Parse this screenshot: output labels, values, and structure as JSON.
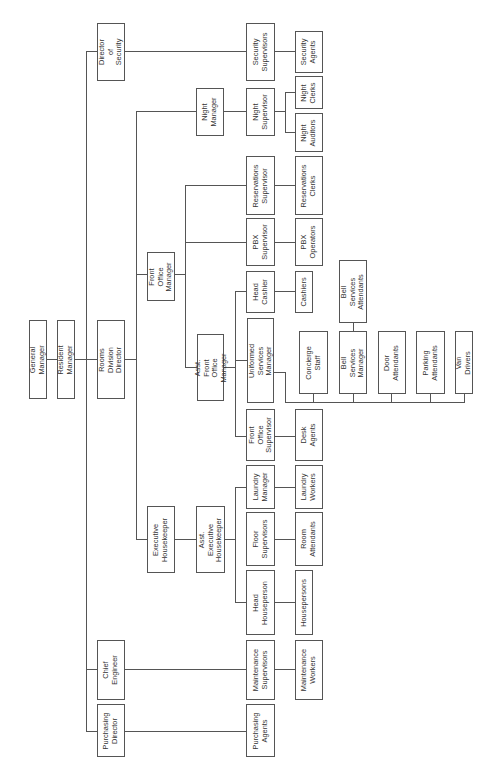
{
  "diagram": {
    "type": "org-chart",
    "orientation": "rotated-90-ccw",
    "line_color": "#555555",
    "nodes": [
      {
        "id": "general-manager",
        "label": "General Manager",
        "box": [
          29,
          320,
          46,
          398
        ]
      },
      {
        "id": "resident-manager",
        "label": "Resident Manager",
        "box": [
          57,
          320,
          74,
          398
        ]
      },
      {
        "id": "rooms-division-director",
        "label": "Rooms Division\nDirector",
        "box": [
          97,
          320,
          124,
          398
        ]
      },
      {
        "id": "director-of-security",
        "label": "Director of\nSecurity",
        "box": [
          97,
          23,
          124,
          80
        ]
      },
      {
        "id": "chief-engineer",
        "label": "Chief\nEngineer",
        "box": [
          97,
          640,
          124,
          699
        ]
      },
      {
        "id": "purchasing-director",
        "label": "Purchasing\nDirector",
        "box": [
          97,
          704,
          124,
          756
        ]
      },
      {
        "id": "front-office-manager",
        "label": "Front Office\nManager",
        "box": [
          147,
          252,
          174,
          300
        ]
      },
      {
        "id": "executive-housekeeper",
        "label": "Executive\nHousekeeper",
        "box": [
          147,
          506,
          174,
          572
        ]
      },
      {
        "id": "night-manager",
        "label": "Night\nManager",
        "box": [
          196,
          88,
          223,
          135
        ]
      },
      {
        "id": "asst-front-office-manager",
        "label": "Asst. Front\nOffice Manager",
        "box": [
          197,
          334,
          223,
          400
        ]
      },
      {
        "id": "asst-executive-housekeeper",
        "label": "Asst. Executive\nHousekeeper",
        "box": [
          196,
          506,
          224,
          572
        ]
      },
      {
        "id": "security-supervisors",
        "label": "Security\nSupervisors",
        "box": [
          246,
          23,
          274,
          80
        ]
      },
      {
        "id": "night-supervisor",
        "label": "Night\nSupervisor",
        "box": [
          246,
          88,
          274,
          135
        ]
      },
      {
        "id": "reservations-supervisor",
        "label": "Reservations\nSupervisor",
        "box": [
          246,
          156,
          274,
          214
        ]
      },
      {
        "id": "pbx-supervisor",
        "label": "PBX\nSupervisor",
        "box": [
          246,
          218,
          274,
          265
        ]
      },
      {
        "id": "head-cashier",
        "label": "Head\nCashier",
        "box": [
          246,
          271,
          274,
          312
        ]
      },
      {
        "id": "uniformed-services-manager",
        "label": "Uniformed Services\nManager",
        "box": [
          247,
          318,
          273,
          402
        ]
      },
      {
        "id": "front-office-supervisor",
        "label": "Front Office\nSupervisor",
        "box": [
          246,
          409,
          274,
          460
        ]
      },
      {
        "id": "laundry-manager",
        "label": "Laundry\nManager",
        "box": [
          246,
          465,
          274,
          508
        ]
      },
      {
        "id": "floor-supervisors",
        "label": "Floor\nSupervisors",
        "box": [
          246,
          512,
          274,
          565
        ]
      },
      {
        "id": "head-houseperson",
        "label": "Head\nHouseperson",
        "box": [
          246,
          570,
          274,
          634
        ]
      },
      {
        "id": "maintenance-supervisors",
        "label": "Maintenance\nSupervisors",
        "box": [
          246,
          640,
          274,
          699
        ]
      },
      {
        "id": "purchasing-agents",
        "label": "Purchasing\nAgents",
        "box": [
          246,
          704,
          274,
          756
        ]
      },
      {
        "id": "security-agents",
        "label": "Security\nAgents",
        "box": [
          295,
          31,
          322,
          72
        ]
      },
      {
        "id": "night-clerks",
        "label": "Night\nClerks",
        "box": [
          295,
          76,
          322,
          108
        ]
      },
      {
        "id": "night-auditors",
        "label": "Night\nAuditors",
        "box": [
          295,
          113,
          322,
          151
        ]
      },
      {
        "id": "reservations-clerks",
        "label": "Reservations\nClerks",
        "box": [
          295,
          156,
          322,
          214
        ]
      },
      {
        "id": "pbx-operators",
        "label": "PBX\nOperators",
        "box": [
          295,
          218,
          322,
          265
        ]
      },
      {
        "id": "cashiers",
        "label": "Cashiers",
        "box": [
          295,
          271,
          312,
          312
        ]
      },
      {
        "id": "concierge-staff",
        "label": "Concierge\nStaff",
        "box": [
          299,
          331,
          327,
          393
        ]
      },
      {
        "id": "desk-agents",
        "label": "Desk\nAgents",
        "box": [
          295,
          409,
          322,
          460
        ]
      },
      {
        "id": "laundry-workers",
        "label": "Laundry\nWorkers",
        "box": [
          295,
          465,
          322,
          508
        ]
      },
      {
        "id": "room-attendants",
        "label": "Room\nAttendants",
        "box": [
          295,
          512,
          322,
          565
        ]
      },
      {
        "id": "housepersons",
        "label": "Housepersons",
        "box": [
          295,
          570,
          312,
          634
        ]
      },
      {
        "id": "maintenance-workers",
        "label": "Maintenance\nWorkers",
        "box": [
          295,
          640,
          322,
          699
        ]
      },
      {
        "id": "bell-services-attendants",
        "label": "Bell Services\nAttendants",
        "box": [
          339,
          260,
          366,
          322
        ]
      },
      {
        "id": "bell-services-manager",
        "label": "Bell Services\nManager",
        "box": [
          339,
          331,
          366,
          393
        ]
      },
      {
        "id": "door-attendants",
        "label": "Door\nAttendants",
        "box": [
          378,
          331,
          405,
          393
        ]
      },
      {
        "id": "parking-attendants",
        "label": "Parking\nAttendants",
        "box": [
          416,
          331,
          444,
          393
        ]
      },
      {
        "id": "van-drivers",
        "label": "Van Drivers",
        "box": [
          455,
          331,
          472,
          393
        ]
      }
    ],
    "edges": [
      [
        "general-manager",
        "resident-manager"
      ],
      [
        "resident-manager",
        "director-of-security"
      ],
      [
        "resident-manager",
        "rooms-division-director"
      ],
      [
        "resident-manager",
        "chief-engineer"
      ],
      [
        "resident-manager",
        "purchasing-director"
      ],
      [
        "director-of-security",
        "security-supervisors"
      ],
      [
        "security-supervisors",
        "security-agents"
      ],
      [
        "rooms-division-director",
        "night-manager"
      ],
      [
        "rooms-division-director",
        "front-office-manager"
      ],
      [
        "rooms-division-director",
        "executive-housekeeper"
      ],
      [
        "night-manager",
        "night-supervisor"
      ],
      [
        "night-supervisor",
        "night-clerks"
      ],
      [
        "night-supervisor",
        "night-auditors"
      ],
      [
        "front-office-manager",
        "reservations-supervisor"
      ],
      [
        "front-office-manager",
        "pbx-supervisor"
      ],
      [
        "front-office-manager",
        "asst-front-office-manager"
      ],
      [
        "reservations-supervisor",
        "reservations-clerks"
      ],
      [
        "pbx-supervisor",
        "pbx-operators"
      ],
      [
        "asst-front-office-manager",
        "head-cashier"
      ],
      [
        "asst-front-office-manager",
        "uniformed-services-manager"
      ],
      [
        "asst-front-office-manager",
        "front-office-supervisor"
      ],
      [
        "head-cashier",
        "cashiers"
      ],
      [
        "front-office-supervisor",
        "desk-agents"
      ],
      [
        "uniformed-services-manager",
        "concierge-staff"
      ],
      [
        "uniformed-services-manager",
        "bell-services-manager"
      ],
      [
        "uniformed-services-manager",
        "door-attendants"
      ],
      [
        "uniformed-services-manager",
        "parking-attendants"
      ],
      [
        "uniformed-services-manager",
        "van-drivers"
      ],
      [
        "bell-services-manager",
        "bell-services-attendants"
      ],
      [
        "executive-housekeeper",
        "asst-executive-housekeeper"
      ],
      [
        "asst-executive-housekeeper",
        "laundry-manager"
      ],
      [
        "asst-executive-housekeeper",
        "floor-supervisors"
      ],
      [
        "asst-executive-housekeeper",
        "head-houseperson"
      ],
      [
        "laundry-manager",
        "laundry-workers"
      ],
      [
        "floor-supervisors",
        "room-attendants"
      ],
      [
        "head-houseperson",
        "housepersons"
      ],
      [
        "chief-engineer",
        "maintenance-supervisors"
      ],
      [
        "maintenance-supervisors",
        "maintenance-workers"
      ],
      [
        "purchasing-director",
        "purchasing-agents"
      ]
    ],
    "connectors": {
      "h": [
        [
          46,
          74,
          359
        ],
        [
          74,
          97,
          359
        ],
        [
          86,
          97,
          51
        ],
        [
          86,
          97,
          669
        ],
        [
          86,
          97,
          731
        ],
        [
          124,
          246,
          51
        ],
        [
          274,
          295,
          51
        ],
        [
          124,
          136,
          359
        ],
        [
          136,
          196,
          111
        ],
        [
          136,
          147,
          274
        ],
        [
          136,
          147,
          539
        ],
        [
          223,
          246,
          111
        ],
        [
          274,
          285,
          111
        ],
        [
          285,
          295,
          92
        ],
        [
          285,
          295,
          132
        ],
        [
          174,
          185,
          274
        ],
        [
          185,
          246,
          185
        ],
        [
          185,
          246,
          242
        ],
        [
          185,
          197,
          367
        ],
        [
          274,
          295,
          185
        ],
        [
          274,
          295,
          242
        ],
        [
          223,
          235,
          367
        ],
        [
          235,
          246,
          291
        ],
        [
          235,
          247,
          360
        ],
        [
          235,
          246,
          436
        ],
        [
          274,
          295,
          291
        ],
        [
          274,
          295,
          436
        ],
        [
          273,
          285,
          372
        ],
        [
          285,
          464,
          402
        ],
        [
          174,
          196,
          539
        ],
        [
          224,
          235,
          539
        ],
        [
          235,
          246,
          487
        ],
        [
          235,
          246,
          602
        ],
        [
          274,
          295,
          487
        ],
        [
          274,
          295,
          539
        ],
        [
          274,
          295,
          602
        ],
        [
          124,
          246,
          669
        ],
        [
          274,
          295,
          669
        ],
        [
          124,
          246,
          731
        ]
      ],
      "v": [
        [
          86,
          51,
          731
        ],
        [
          136,
          111,
          539
        ],
        [
          285,
          92,
          132
        ],
        [
          185,
          185,
          367
        ],
        [
          235,
          291,
          436
        ],
        [
          285,
          372,
          402
        ],
        [
          313,
          393,
          402
        ],
        [
          353,
          393,
          402
        ],
        [
          391,
          393,
          402
        ],
        [
          430,
          393,
          402
        ],
        [
          464,
          393,
          402
        ],
        [
          353,
          322,
          331
        ],
        [
          235,
          487,
          602
        ]
      ]
    }
  }
}
